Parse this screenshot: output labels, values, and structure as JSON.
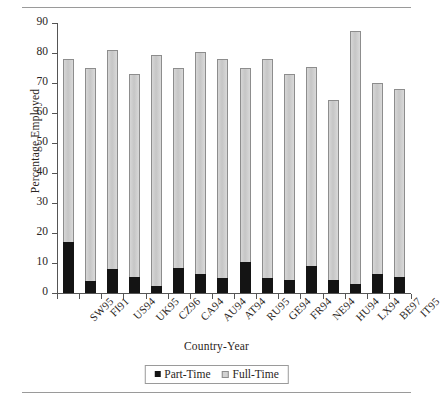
{
  "figure": {
    "y_axis_title": "Percentage Employed",
    "x_axis_title": "Country-Year"
  },
  "legend": {
    "items": [
      {
        "label": "Part-Time",
        "swatch": "black-square-icon",
        "color": "#141414"
      },
      {
        "label": "Full-Time",
        "swatch": "gray-square-icon",
        "color": "#d2d2d2"
      }
    ]
  },
  "chart_data": {
    "type": "bar",
    "subtype": "stacked",
    "title": "",
    "xlabel": "Country-Year",
    "ylabel": "Percentage Employed",
    "ylim": [
      0,
      90
    ],
    "yticks": [
      0,
      10,
      20,
      30,
      40,
      50,
      60,
      70,
      80,
      90
    ],
    "grid": false,
    "legend_position": "bottom-center",
    "categories": [
      "SW95",
      "FI91",
      "US94",
      "UK95",
      "CZ96",
      "CA94",
      "AU94",
      "AT94",
      "RU95",
      "GE94",
      "FR94",
      "NE94",
      "HU94",
      "LX94",
      "BE97",
      "IT95"
    ],
    "series": [
      {
        "name": "Part-Time",
        "color": "#141414",
        "values": [
          17,
          4,
          8,
          5.5,
          2.5,
          8.5,
          6.5,
          5,
          10.5,
          5,
          4.5,
          9,
          4.5,
          3,
          6.5,
          5.5
        ]
      },
      {
        "name": "Full-Time",
        "color": "#d2d2d2",
        "values": [
          61,
          71,
          73,
          67.5,
          77,
          66.5,
          74,
          73,
          64.5,
          73,
          68.5,
          66.5,
          60,
          84.5,
          63.5,
          62.5
        ]
      }
    ],
    "totals": [
      78,
      75,
      81,
      73,
      79.5,
      75,
      80.5,
      78,
      75,
      78,
      73,
      75.5,
      64.5,
      87.5,
      70,
      68
    ]
  }
}
